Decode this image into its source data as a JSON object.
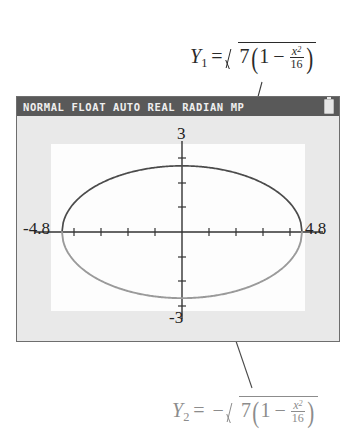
{
  "calculator": {
    "status_bar": {
      "text": "NORMAL FLOAT AUTO REAL RADIAN MP",
      "battery_icon": "battery-icon"
    },
    "graph": {
      "x_min_label": "-4.8",
      "x_max_label": "4.8",
      "y_max_label": "3",
      "y_min_label": "-3"
    }
  },
  "annotations": {
    "top": {
      "y_name": "Y",
      "y_sub": "1",
      "equals": "=",
      "leading_minus": "",
      "coefficient": "7",
      "paren_open": "(",
      "one": "1",
      "minus": "−",
      "frac_num": "x",
      "frac_num_exp": "2",
      "frac_den": "16",
      "paren_close": ")"
    },
    "bottom": {
      "y_name": "Y",
      "y_sub": "2",
      "equals": "=",
      "leading_minus": "−",
      "coefficient": "7",
      "paren_open": "(",
      "one": "1",
      "minus": "−",
      "frac_num": "x",
      "frac_num_exp": "2",
      "frac_den": "16",
      "paren_close": ")"
    }
  },
  "chart_data": {
    "type": "line",
    "title": "",
    "xlabel": "",
    "ylabel": "",
    "xlim": [
      -4.8,
      4.8
    ],
    "ylim": [
      -3.1,
      3.1
    ],
    "grid": false,
    "legend": "none",
    "tick_step_x": 1,
    "tick_step_y": 1,
    "series": [
      {
        "name": "Y1",
        "expression": "sqrt(7*(1 - x^2/16))",
        "color": "#4b4b4b",
        "domain": [
          -4,
          4
        ],
        "x": [
          -4,
          -3.5,
          -3,
          -2.5,
          -2,
          -1.5,
          -1,
          -0.5,
          0,
          0.5,
          1,
          1.5,
          2,
          2.5,
          3,
          3.5,
          4
        ],
        "y": [
          0,
          1.28,
          1.75,
          2.07,
          2.29,
          2.45,
          2.56,
          2.62,
          2.65,
          2.62,
          2.56,
          2.45,
          2.29,
          2.07,
          1.75,
          1.28,
          0
        ]
      },
      {
        "name": "Y2",
        "expression": "-sqrt(7*(1 - x^2/16))",
        "color": "#9a9a9a",
        "domain": [
          -4,
          4
        ],
        "x": [
          -4,
          -3.5,
          -3,
          -2.5,
          -2,
          -1.5,
          -1,
          -0.5,
          0,
          0.5,
          1,
          1.5,
          2,
          2.5,
          3,
          3.5,
          4
        ],
        "y": [
          0,
          -1.28,
          -1.75,
          -2.07,
          -2.29,
          -2.45,
          -2.56,
          -2.62,
          -2.65,
          -2.62,
          -2.56,
          -2.45,
          -2.29,
          -2.07,
          -1.75,
          -1.28,
          0
        ]
      }
    ]
  }
}
